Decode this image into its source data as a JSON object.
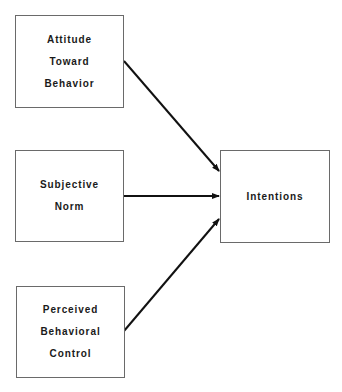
{
  "diagram": {
    "boxes": [
      {
        "id": "attitude",
        "lines": [
          "Attitude",
          "Toward",
          "Behavior"
        ],
        "x": 15,
        "y": 15,
        "w": 109,
        "h": 93
      },
      {
        "id": "norm",
        "lines": [
          "Subjective",
          "Norm"
        ],
        "x": 15,
        "y": 150,
        "w": 109,
        "h": 92
      },
      {
        "id": "control",
        "lines": [
          "Perceived",
          "Behavioral",
          "Control"
        ],
        "x": 16,
        "y": 286,
        "w": 109,
        "h": 92
      },
      {
        "id": "intentions",
        "lines": [
          "Intentions"
        ],
        "x": 220,
        "y": 150,
        "w": 110,
        "h": 93
      }
    ],
    "edges": [
      {
        "from": "attitude",
        "to": "intentions"
      },
      {
        "from": "norm",
        "to": "intentions"
      },
      {
        "from": "control",
        "to": "intentions"
      }
    ],
    "colors": {
      "line": "#111111",
      "border": "#6a6a6a"
    }
  }
}
